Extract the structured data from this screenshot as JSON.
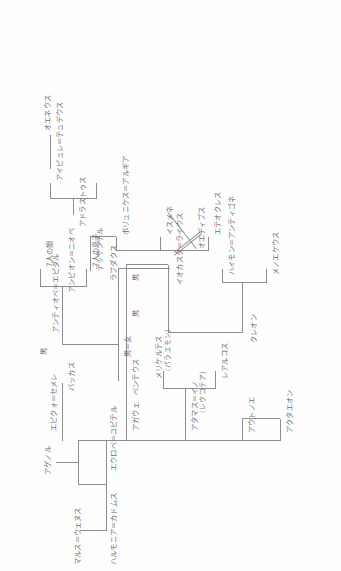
{
  "document": {
    "kind": "hand-drawn-genealogy-chart",
    "orientation": "rotated-90-ccw",
    "ink_color": "#8d8d91",
    "text_color": "#6f6f72",
    "page_color": "#fefefe"
  },
  "nodes": {
    "mars_venus": "マルス＝ウェヌス",
    "harmonia_cadmus": "ハルモニア＝カドムス",
    "agenor": "アゲノル",
    "europa_jupiter": "エウロペ＝ユピテル",
    "autonoe": "アウトノエ",
    "actaeon": "アクタエオン",
    "athamas_ino": "アタマス＝イノ",
    "leucothea": "（レウコテア）",
    "learchus": "レアルコス",
    "melicertes": "メリケルテス",
    "palaemon": "（パラエモン）",
    "agaue": "アガウェ",
    "pentheus": "ペンテウス",
    "epiclo_semele": "エピクォ＝セメレ",
    "bacchus": "バッカス",
    "male_1": "男",
    "male_2": "男",
    "male_female": "男＝女",
    "male_3": "男",
    "antiope_epidal": "アンティオペ＝エピダル",
    "amphion_niobe": "アンピオン＝ニオベ",
    "seven_sons": "7人の息子",
    "seven_daughters": "7人の娘",
    "labdacus": "ラブダクス",
    "iocasta_laius": "イオカスタ＝ライウス",
    "oedipus": "オエディプス",
    "creon": "クレオン",
    "menoeceus": "メノエケウス",
    "haemon_antigone": "ハイモン＝アンティゴネ",
    "ismene": "イスメネ",
    "eteocles": "エテオクレス",
    "polyneices_argia": "ポリュニケス＝アルギア",
    "thersander": "テッサンデル",
    "adrastus": "アドラストゥス",
    "aigialeia_tydeus": "アイピュレ＝テュデウス",
    "oeneus": "オエネウス"
  }
}
